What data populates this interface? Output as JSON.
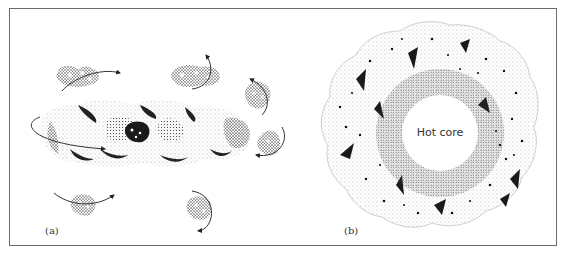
{
  "figure": {
    "panels": [
      {
        "id": "a",
        "label": "(a)",
        "description": "Small molecules tumbling with rotation arrows around a large elongated stippled macromolecule"
      },
      {
        "id": "b",
        "label": "(b)",
        "description": "Roughly circular stippled globular structure with a densely stippled ring surrounding a central white region",
        "core_label": "Hot core"
      }
    ],
    "colors": {
      "frame": "#6a6a6a",
      "ink": "#1a1a1a",
      "background": "#ffffff"
    }
  }
}
